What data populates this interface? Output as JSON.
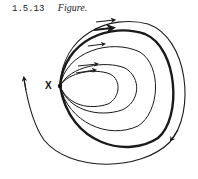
{
  "caption": {
    "number": "1.5.13",
    "title": "Figure."
  },
  "diagram": {
    "point_label": "X",
    "stroke_color": "#1a1a1a",
    "curves": [
      {
        "id": "orbit-1",
        "direction": "clockwise",
        "weight": "thin"
      },
      {
        "id": "orbit-2",
        "direction": "clockwise",
        "weight": "thin"
      },
      {
        "id": "orbit-3",
        "direction": "clockwise",
        "weight": "thin"
      },
      {
        "id": "orbit-4",
        "direction": "clockwise",
        "weight": "thick"
      },
      {
        "id": "outer-curve",
        "direction": "clockwise",
        "weight": "thin",
        "closed": false
      }
    ]
  }
}
